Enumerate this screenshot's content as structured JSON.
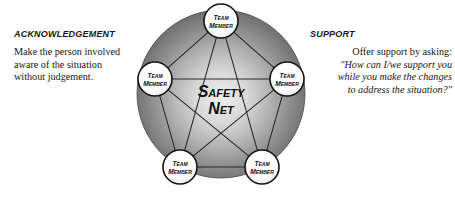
{
  "background_color": "#ffffff",
  "left_panel": {
    "heading": "Acknowledgement",
    "body_lines": [
      "Make the person involved",
      "aware of the situation",
      "without judgement."
    ]
  },
  "right_panel": {
    "heading": "Support",
    "intro": "Offer support by asking:",
    "quote_lines": [
      "\"How can I/we support you",
      "while you make the changes",
      "to address the situation?\""
    ]
  },
  "diagram": {
    "center_label_line1": "Safety",
    "center_label_line2": "Net",
    "sphere_color_outer": "#6d6d6d",
    "sphere_color_inner": "#e9e9e9",
    "line_color": "#2b2b2b",
    "node_fill": "#fbfbfb",
    "node_stroke": "#141414",
    "nodes": [
      {
        "id": "node-top",
        "label_line1": "Team",
        "label_line2": "Member",
        "cx": 90,
        "cy": 21
      },
      {
        "id": "node-right",
        "label_line1": "Team",
        "label_line2": "Member",
        "cx": 156,
        "cy": 79
      },
      {
        "id": "node-bottom-right",
        "label_line1": "Team",
        "label_line2": "Member",
        "cx": 131,
        "cy": 167
      },
      {
        "id": "node-bottom-left",
        "label_line1": "Team",
        "label_line2": "Member",
        "cx": 49,
        "cy": 167
      },
      {
        "id": "node-left",
        "label_line1": "Team",
        "label_line2": "Member",
        "cx": 24,
        "cy": 79
      }
    ],
    "pentagon_edges": [
      [
        0,
        1
      ],
      [
        1,
        2
      ],
      [
        2,
        3
      ],
      [
        3,
        4
      ],
      [
        4,
        0
      ]
    ],
    "star_edges": [
      [
        0,
        2
      ],
      [
        2,
        4
      ],
      [
        4,
        1
      ],
      [
        1,
        3
      ],
      [
        3,
        0
      ]
    ]
  }
}
